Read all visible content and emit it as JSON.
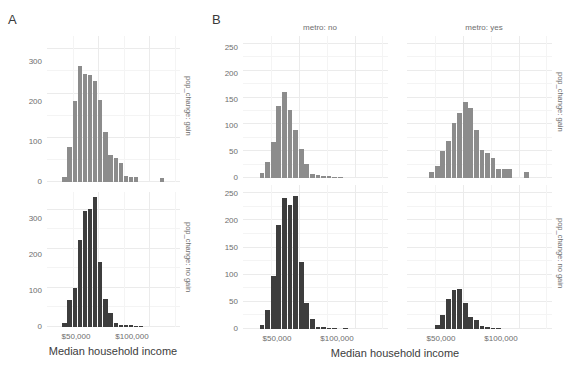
{
  "figure": {
    "panels": [
      {
        "letter": "A",
        "x_axis_title": "Median household income",
        "x_ticks": [
          "$50,000",
          "$100,000"
        ],
        "x_tick_values": [
          50000,
          100000
        ],
        "x_range": [
          0,
          130000
        ],
        "row_strips": [
          "pop_change: gain",
          "pop_change: no gain"
        ],
        "col_strips": []
      },
      {
        "letter": "B",
        "x_axis_title": "Median household income",
        "x_ticks": [
          "$50,000",
          "$100,000"
        ],
        "x_tick_values": [
          50000,
          100000
        ],
        "x_range": [
          0,
          130000
        ],
        "row_strips": [
          "pop_change: gain",
          "pop_change: no gain"
        ],
        "col_strips": [
          "metro: no",
          "metro: yes"
        ]
      }
    ],
    "colors": {
      "bar_gain": "#8c8c8c",
      "bar_no_gain": "#3d3d3d",
      "gridline": "#ebebeb",
      "gridline_minor": "#f4f4f4",
      "tick_label": "#6e6e6e",
      "axis_title": "#3c3c3c",
      "background": "#ffffff"
    }
  },
  "chart_data": [
    {
      "type": "bar",
      "id": "A-gain",
      "title": "",
      "panel": "A",
      "facet_row": "pop_change: gain",
      "facet_col": "",
      "xlabel": "Median household income",
      "ylabel": "",
      "ylim": [
        0,
        330
      ],
      "yticks": [
        0,
        100,
        200,
        300
      ],
      "xlim": [
        0,
        130000
      ],
      "xticks": [
        50000,
        100000
      ],
      "xtick_labels": [
        "$50,000",
        "$100,000"
      ],
      "grid": true,
      "bin_width": 5000,
      "bin_centers": [
        17500,
        22500,
        27500,
        32500,
        37500,
        42500,
        47500,
        52500,
        57500,
        62500,
        67500,
        72500,
        77500,
        82500,
        87500,
        92500,
        97500,
        102500,
        112500
      ],
      "values": [
        12,
        80,
        183,
        262,
        244,
        241,
        228,
        185,
        113,
        62,
        55,
        44,
        13,
        12,
        12,
        0,
        0,
        0,
        8
      ]
    },
    {
      "type": "bar",
      "id": "A-no-gain",
      "title": "",
      "panel": "A",
      "facet_row": "pop_change: no gain",
      "facet_col": "",
      "xlabel": "Median household income",
      "ylabel": "",
      "ylim": [
        0,
        345
      ],
      "yticks": [
        0,
        100,
        200,
        300
      ],
      "xlim": [
        0,
        130000
      ],
      "xticks": [
        50000,
        100000
      ],
      "xtick_labels": [
        "$50,000",
        "$100,000"
      ],
      "grid": true,
      "bin_width": 5000,
      "bin_centers": [
        17500,
        22500,
        27500,
        32500,
        37500,
        42500,
        47500,
        52500,
        57500,
        62500,
        67500,
        72500,
        77500,
        82500,
        87500,
        92500
      ],
      "values": [
        10,
        68,
        100,
        222,
        297,
        302,
        332,
        165,
        72,
        37,
        10,
        5,
        6,
        4,
        3,
        2
      ]
    },
    {
      "type": "bar",
      "id": "B-no-gain-metro-no",
      "title": "",
      "panel": "B",
      "facet_row": "pop_change: gain",
      "facet_col": "metro: no",
      "xlabel": "Median household income",
      "ylabel": "",
      "ylim": [
        0,
        265
      ],
      "yticks": [
        0,
        50,
        100,
        150,
        200,
        250
      ],
      "xlim": [
        0,
        130000
      ],
      "xticks": [
        50000,
        100000
      ],
      "xtick_labels": [
        "$50,000",
        "$100,000"
      ],
      "grid": true,
      "bin_width": 5000,
      "bin_centers": [
        17500,
        22500,
        27500,
        32500,
        37500,
        42500,
        47500,
        52500,
        57500,
        62500,
        67500,
        72500,
        77500,
        82500,
        87500
      ],
      "values": [
        10,
        30,
        68,
        134,
        161,
        127,
        89,
        55,
        26,
        8,
        5,
        4,
        3,
        2,
        2
      ]
    },
    {
      "type": "bar",
      "id": "B-gain-metro-yes",
      "title": "",
      "panel": "B",
      "facet_row": "pop_change: gain",
      "facet_col": "metro: yes",
      "xlabel": "Median household income",
      "ylabel": "",
      "ylim": [
        0,
        265
      ],
      "yticks": [
        0,
        50,
        100,
        150,
        200,
        250
      ],
      "xlim": [
        0,
        130000
      ],
      "xticks": [
        50000,
        100000
      ],
      "xtick_labels": [
        "$50,000",
        "$100,000"
      ],
      "grid": true,
      "bin_width": 5000,
      "bin_centers": [
        22500,
        27500,
        32500,
        37500,
        42500,
        47500,
        52500,
        57500,
        62500,
        67500,
        72500,
        77500,
        82500,
        87500,
        92500,
        97500,
        107500
      ],
      "values": [
        11,
        22,
        50,
        70,
        103,
        121,
        141,
        131,
        89,
        53,
        46,
        38,
        17,
        16,
        16,
        0,
        11
      ]
    },
    {
      "type": "bar",
      "id": "B-no-gain-metro-no-bottom",
      "title": "",
      "panel": "B",
      "facet_row": "pop_change: no gain",
      "facet_col": "metro: no",
      "xlabel": "Median household income",
      "ylabel": "",
      "ylim": [
        0,
        265
      ],
      "yticks": [
        0,
        50,
        100,
        150,
        200,
        250
      ],
      "xlim": [
        0,
        130000
      ],
      "xticks": [
        50000,
        100000
      ],
      "xtick_labels": [
        "$50,000",
        "$100,000"
      ],
      "grid": true,
      "bin_width": 5000,
      "bin_centers": [
        17500,
        22500,
        27500,
        32500,
        37500,
        42500,
        47500,
        52500,
        57500,
        62500,
        67500,
        72500,
        77500,
        82500,
        92500
      ],
      "values": [
        7,
        35,
        97,
        191,
        242,
        229,
        245,
        124,
        47,
        18,
        4,
        3,
        2,
        2,
        2
      ]
    },
    {
      "type": "bar",
      "id": "B-no-gain-metro-yes",
      "title": "",
      "panel": "B",
      "facet_row": "pop_change: no gain",
      "facet_col": "metro: yes",
      "xlabel": "Median household income",
      "ylabel": "",
      "ylim": [
        0,
        265
      ],
      "yticks": [
        0,
        50,
        100,
        150,
        200,
        250
      ],
      "xlim": [
        0,
        130000
      ],
      "xticks": [
        50000,
        100000
      ],
      "xtick_labels": [
        "$50,000",
        "$100,000"
      ],
      "grid": true,
      "bin_width": 5000,
      "bin_centers": [
        27500,
        32500,
        37500,
        42500,
        47500,
        52500,
        57500,
        62500,
        67500,
        72500,
        77500,
        82500
      ],
      "values": [
        8,
        25,
        56,
        72,
        74,
        48,
        22,
        16,
        6,
        3,
        2,
        2
      ]
    }
  ],
  "labels": {
    "panel_a_letter": "A",
    "panel_b_letter": "B",
    "strip_metro_no": "metro: no",
    "strip_metro_yes": "metro: yes",
    "strip_gain": "pop_change: gain",
    "strip_no_gain": "pop_change: no gain",
    "x_axis_title": "Median household income",
    "xtick_50k": "$50,000",
    "xtick_100k": "$100,000",
    "y_0": "0",
    "y_50": "50",
    "y_100": "100",
    "y_150": "150",
    "y_200": "200",
    "y_250": "250",
    "y_300": "300"
  }
}
